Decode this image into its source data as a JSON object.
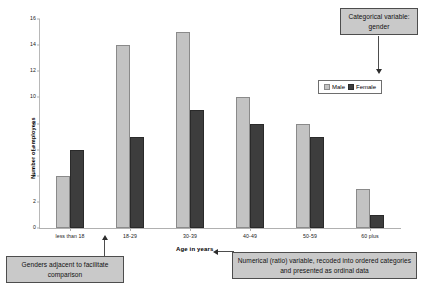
{
  "chart_data": {
    "type": "bar",
    "title": "",
    "xlabel": "Age in years",
    "ylabel": "Number of employees",
    "categories": [
      "less than 18",
      "18-29",
      "30-39",
      "40-49",
      "50-59",
      "60 plus"
    ],
    "series": [
      {
        "name": "Male",
        "values": [
          4,
          14,
          15,
          10,
          8,
          3
        ],
        "color": "#c3c3c3"
      },
      {
        "name": "Female",
        "values": [
          6,
          7,
          9,
          8,
          7,
          1
        ],
        "color": "#3d3d3d"
      }
    ],
    "ylim": [
      0,
      16
    ],
    "yticks": [
      0,
      2,
      4,
      6,
      8,
      10,
      12,
      14,
      16
    ],
    "grid": false,
    "legend_position": "upper right",
    "legend_entries": [
      "Male",
      "Female"
    ],
    "annotations": [
      "Categorical variable: gender",
      "Genders adjacent to facilitate comparison",
      "Numerical (ratio) variable, recoded into ordered categories and presented as ordinal data"
    ]
  },
  "axes": {
    "y_label": "Number of employees",
    "x_label": "Age in years",
    "y_ticks": [
      "0",
      "2",
      "4",
      "6",
      "8",
      "10",
      "12",
      "14",
      "16"
    ],
    "x_ticks": [
      "less than 18",
      "18-29",
      "30-39",
      "40-49",
      "50-59",
      "60 plus"
    ]
  },
  "legend": {
    "male_label": "Male",
    "female_label": "Female"
  },
  "callouts": {
    "gender": "Categorical variable: gender",
    "adjacent": "Genders adjacent to facilitate comparison",
    "ordinal": "Numerical (ratio) variable, recoded into ordered categories and presented as ordinal data"
  }
}
